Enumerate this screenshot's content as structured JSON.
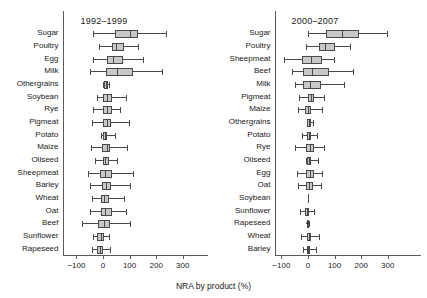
{
  "figure": {
    "axis_caption": "NRA by product (%)",
    "box_fill": "#c8c8c8",
    "line_color": "#4a4a4a"
  },
  "chart_data": {
    "type": "boxplot",
    "title": "",
    "xlabel": "NRA by product (%)",
    "ylabel": "",
    "xlim": [
      -140,
      330
    ],
    "xticks": [
      -100,
      0,
      100,
      200,
      300
    ],
    "xticklabels": [
      "−100",
      "0",
      "100",
      "200",
      "300"
    ],
    "grid": false,
    "legend": null,
    "orientation": "horizontal",
    "panels": [
      {
        "name": "left-panel",
        "title": "1992–1999",
        "categories": [
          "Sugar",
          "Poultry",
          "Egg",
          "Milk",
          "Othergrains",
          "Soybean",
          "Rye",
          "Pigmeat",
          "Potato",
          "Maize",
          "Oilseed",
          "Sheepmeat",
          "Barley",
          "Wheat",
          "Oat",
          "Beef",
          "Sunflower",
          "Rapeseed"
        ],
        "boxes": [
          {
            "category": "Sugar",
            "whisker_low": -37,
            "q1": 45,
            "median": 100,
            "q3": 133,
            "whisker_high": 237,
            "outliers": []
          },
          {
            "category": "Poultry",
            "whisker_low": -15,
            "q1": 33,
            "median": 48,
            "q3": 78,
            "whisker_high": 133,
            "outliers": []
          },
          {
            "category": "Egg",
            "whisker_low": -37,
            "q1": 15,
            "median": 37,
            "q3": 74,
            "whisker_high": 152,
            "outliers": []
          },
          {
            "category": "Milk",
            "whisker_low": -48,
            "q1": 11,
            "median": 52,
            "q3": 111,
            "whisker_high": 222,
            "outliers": []
          },
          {
            "category": "Othergrains",
            "whisker_low": 0,
            "q1": 4,
            "median": 11,
            "q3": 19,
            "whisker_high": 22,
            "outliers": []
          },
          {
            "category": "Soybean",
            "whisker_low": -22,
            "q1": 0,
            "median": 15,
            "q3": 33,
            "whisker_high": 85,
            "outliers": []
          },
          {
            "category": "Rye",
            "whisker_low": -37,
            "q1": 0,
            "median": 15,
            "q3": 33,
            "whisker_high": 63,
            "outliers": []
          },
          {
            "category": "Pigmeat",
            "whisker_low": -41,
            "q1": 0,
            "median": 15,
            "q3": 30,
            "whisker_high": 96,
            "outliers": []
          },
          {
            "category": "Potato",
            "whisker_low": -7,
            "q1": 0,
            "median": 7,
            "q3": 15,
            "whisker_high": 44,
            "outliers": []
          },
          {
            "category": "Maize",
            "whisker_low": -44,
            "q1": -4,
            "median": 15,
            "q3": 26,
            "whisker_high": 89,
            "outliers": []
          },
          {
            "category": "Oilseed",
            "whisker_low": -30,
            "q1": 0,
            "median": 7,
            "q3": 22,
            "whisker_high": 52,
            "outliers": []
          },
          {
            "category": "Sheepmeat",
            "whisker_low": -56,
            "q1": -11,
            "median": 7,
            "q3": 33,
            "whisker_high": 111,
            "outliers": []
          },
          {
            "category": "Barley",
            "whisker_low": -48,
            "q1": -4,
            "median": 11,
            "q3": 30,
            "whisker_high": 100,
            "outliers": []
          },
          {
            "category": "Wheat",
            "whisker_low": -41,
            "q1": -7,
            "median": 4,
            "q3": 22,
            "whisker_high": 78,
            "outliers": []
          },
          {
            "category": "Oat",
            "whisker_low": -48,
            "q1": -7,
            "median": 7,
            "q3": 33,
            "whisker_high": 85,
            "outliers": []
          },
          {
            "category": "Beef",
            "whisker_low": -78,
            "q1": -19,
            "median": 4,
            "q3": 26,
            "whisker_high": 100,
            "outliers": []
          },
          {
            "category": "Sunflower",
            "whisker_low": -37,
            "q1": -22,
            "median": -7,
            "q3": 4,
            "whisker_high": 22,
            "outliers": []
          },
          {
            "category": "Rapeseed",
            "whisker_low": -41,
            "q1": -22,
            "median": -11,
            "q3": 0,
            "whisker_high": 26,
            "outliers": []
          }
        ]
      },
      {
        "name": "right-panel",
        "title": "2000–2007",
        "categories": [
          "Sugar",
          "Poultry",
          "Sheepmeat",
          "Beef",
          "Milk",
          "Pigmeat",
          "Maize",
          "Othergrains",
          "Potato",
          "Rye",
          "Oilseed",
          "Egg",
          "Oat",
          "Soybean",
          "Sunflower",
          "Rapeseed",
          "Wheat",
          "Barley"
        ],
        "boxes": [
          {
            "category": "Sugar",
            "whisker_low": 0,
            "q1": 67,
            "median": 126,
            "q3": 193,
            "whisker_high": 296,
            "outliers": []
          },
          {
            "category": "Poultry",
            "whisker_low": -7,
            "q1": 41,
            "median": 63,
            "q3": 100,
            "whisker_high": 159,
            "outliers": []
          },
          {
            "category": "Sheepmeat",
            "whisker_low": -89,
            "q1": -22,
            "median": 11,
            "q3": 52,
            "whisker_high": 96,
            "outliers": []
          },
          {
            "category": "Beef",
            "whisker_low": -59,
            "q1": -19,
            "median": 15,
            "q3": 78,
            "whisker_high": 170,
            "outliers": []
          },
          {
            "category": "Milk",
            "whisker_low": -48,
            "q1": -19,
            "median": 7,
            "q3": 48,
            "whisker_high": 137,
            "outliers": []
          },
          {
            "category": "Pigmeat",
            "whisker_low": -33,
            "q1": 0,
            "median": 11,
            "q3": 22,
            "whisker_high": 59,
            "outliers": []
          },
          {
            "category": "Maize",
            "whisker_low": -37,
            "q1": -11,
            "median": 0,
            "q3": 11,
            "whisker_high": 52,
            "outliers": []
          },
          {
            "category": "Othergrains",
            "whisker_low": -4,
            "q1": -4,
            "median": 4,
            "q3": 11,
            "whisker_high": 19,
            "outliers": []
          },
          {
            "category": "Potato",
            "whisker_low": -22,
            "q1": -4,
            "median": 4,
            "q3": 11,
            "whisker_high": 33,
            "outliers": []
          },
          {
            "category": "Rye",
            "whisker_low": -48,
            "q1": -7,
            "median": 7,
            "q3": 22,
            "whisker_high": 59,
            "outliers": []
          },
          {
            "category": "Oilseed",
            "whisker_low": -7,
            "q1": -4,
            "median": 4,
            "q3": 11,
            "whisker_high": 37,
            "outliers": []
          },
          {
            "category": "Egg",
            "whisker_low": -41,
            "q1": -7,
            "median": 7,
            "q3": 22,
            "whisker_high": 52,
            "outliers": []
          },
          {
            "category": "Oat",
            "whisker_low": -37,
            "q1": -7,
            "median": 4,
            "q3": 19,
            "whisker_high": 48,
            "outliers": []
          },
          {
            "category": "Soybean",
            "whisker_low": 0,
            "q1": 0,
            "median": 0,
            "q3": 0,
            "whisker_high": 0,
            "outliers": []
          },
          {
            "category": "Sunflower",
            "whisker_low": -30,
            "q1": -11,
            "median": -4,
            "q3": 4,
            "whisker_high": 22,
            "outliers": []
          },
          {
            "category": "Rapeseed",
            "whisker_low": 0,
            "q1": -4,
            "median": 0,
            "q3": 4,
            "whisker_high": 4,
            "outliers": [
              -4,
              4
            ]
          },
          {
            "category": "Wheat",
            "whisker_low": -26,
            "q1": -4,
            "median": 4,
            "q3": 11,
            "whisker_high": 41,
            "outliers": []
          },
          {
            "category": "Barley",
            "whisker_low": -19,
            "q1": -4,
            "median": 0,
            "q3": 7,
            "whisker_high": 30,
            "outliers": []
          }
        ]
      }
    ]
  }
}
